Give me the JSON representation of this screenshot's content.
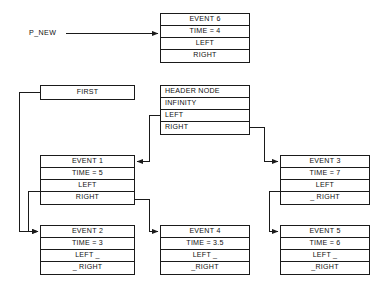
{
  "diagram": {
    "pointers": [
      {
        "name": "p-new",
        "label": "P_NEW"
      }
    ],
    "nodes": [
      {
        "id": "event6",
        "name": "event-6",
        "rows": [
          "EVENT 6",
          "TIME = 4",
          "LEFT",
          "RIGHT"
        ],
        "align": "center"
      },
      {
        "id": "first",
        "name": "first",
        "rows": [
          "FIRST"
        ],
        "align": "center"
      },
      {
        "id": "header",
        "name": "header-node",
        "rows": [
          "HEADER NODE",
          "INFINITY",
          "LEFT",
          "RIGHT"
        ],
        "align": "left"
      },
      {
        "id": "event1",
        "name": "event-1",
        "rows": [
          "EVENT 1",
          "TIME = 5",
          "LEFT",
          "RIGHT"
        ],
        "align": "center"
      },
      {
        "id": "event3",
        "name": "event-3",
        "rows": [
          "EVENT 3",
          "TIME = 7",
          "LEFT",
          "_ RIGHT"
        ],
        "align": "center"
      },
      {
        "id": "event2",
        "name": "event-2",
        "rows": [
          "EVENT 2",
          "TIME = 3",
          "LEFT _",
          "_ RIGHT"
        ],
        "align": "center"
      },
      {
        "id": "event4",
        "name": "event-4",
        "rows": [
          "EVENT 4",
          "TIME = 3.5",
          "LEFT _",
          "_RIGHT"
        ],
        "align": "center"
      },
      {
        "id": "event5",
        "name": "event-5",
        "rows": [
          "EVENT 5",
          "TIME = 6",
          "LEFT _",
          "_RIGHT"
        ],
        "align": "center"
      }
    ],
    "edges": [
      {
        "name": "edge-pnew-to-event6",
        "from": "P_NEW",
        "to": "EVENT 6"
      },
      {
        "name": "edge-first-to-event2",
        "from": "FIRST",
        "to": "EVENT 2"
      },
      {
        "name": "edge-header-left-to-event1",
        "from": "HEADER NODE.LEFT",
        "to": "EVENT 1"
      },
      {
        "name": "edge-header-right-to-event3",
        "from": "HEADER NODE.RIGHT",
        "to": "EVENT 3"
      },
      {
        "name": "edge-event1-left-to-event2",
        "from": "EVENT 1.LEFT",
        "to": "EVENT 2"
      },
      {
        "name": "edge-event1-right-to-event4",
        "from": "EVENT 1.RIGHT",
        "to": "EVENT 4"
      },
      {
        "name": "edge-event3-left-to-event5",
        "from": "EVENT 3.LEFT",
        "to": "EVENT 5"
      }
    ],
    "colors": {
      "line": "#1a1a1a",
      "text": "#111111",
      "background": "#ffffff"
    }
  }
}
